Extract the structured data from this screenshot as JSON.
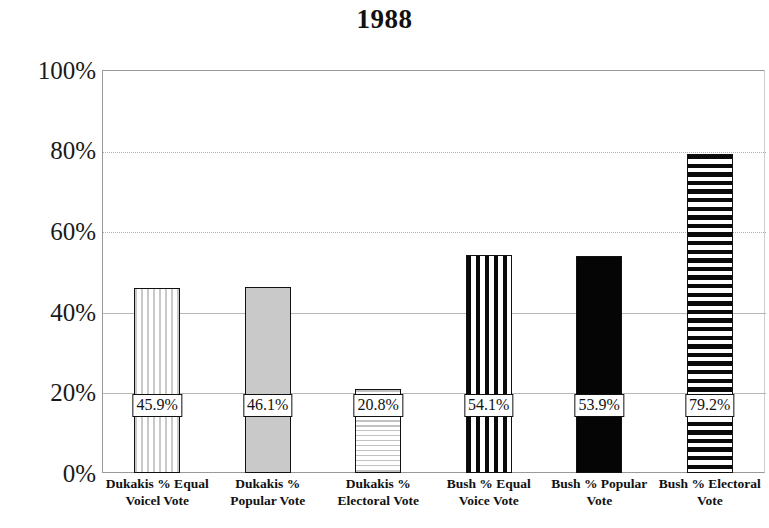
{
  "chart_data": {
    "type": "bar",
    "title": "1988",
    "xlabel": "",
    "ylabel": "",
    "ylim": [
      0,
      100
    ],
    "ytick_labels": [
      "100%",
      "80%",
      "60%",
      "40%",
      "20%",
      "0%"
    ],
    "ytick_values": [
      100,
      80,
      60,
      40,
      20,
      0
    ],
    "grid": true,
    "legend": "none",
    "categories": [
      "Dukakis % Equal Voicel Vote",
      "Dukakis % Popular Vote",
      "Dukakis % Electoral Vote",
      "Bush % Equal Voice Vote",
      "Bush % Popular Vote",
      "Bush % Electoral Vote"
    ],
    "category_lines": [
      [
        "Dukakis % Equal",
        "Voicel Vote"
      ],
      [
        "Dukakis %",
        "Popular Vote"
      ],
      [
        "Dukakis %",
        "Electoral Vote"
      ],
      [
        "Bush % Equal",
        "Voice Vote"
      ],
      [
        "Bush % Popular",
        "Vote"
      ],
      [
        "Bush % Electoral",
        "Vote"
      ]
    ],
    "values": [
      45.9,
      46.1,
      20.8,
      54.1,
      53.9,
      79.2
    ],
    "value_labels": [
      "45.9%",
      "46.1%",
      "20.8%",
      "54.1%",
      "53.9%",
      "79.2%"
    ],
    "bar_fills": [
      "vertical-stripe-light",
      "solid-gray",
      "horizontal-stripe-light",
      "vertical-stripe-bold",
      "solid-black",
      "horizontal-stripe-bold"
    ],
    "colors": {
      "bar_outline": "#111111",
      "light_pattern": "#c9c9c9",
      "dark_pattern": "#0a0a0a",
      "gridline": "#b6b6b6",
      "axis": "#9a9a9a",
      "text": "#111111",
      "background": "#ffffff"
    }
  }
}
